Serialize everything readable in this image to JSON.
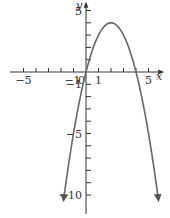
{
  "chart_data": {
    "type": "line",
    "title": "",
    "function": "y = -x^2 + 4x",
    "xlabel": "x",
    "ylabel": "y",
    "xlim": [
      -6,
      6.5
    ],
    "ylim": [
      -11.5,
      5.8
    ],
    "x_ticks": [
      -5,
      -4,
      -3,
      -2,
      -1,
      1,
      2,
      3,
      4,
      5
    ],
    "y_ticks": [
      5,
      4,
      3,
      2,
      1,
      -1,
      -2,
      -3,
      -4,
      -5,
      -6,
      -7,
      -8,
      -9,
      -10
    ],
    "x_tick_labels": [
      {
        "value": -5,
        "text": "−5"
      },
      {
        "value": -1,
        "text": "−1"
      },
      {
        "value": 0,
        "text": "0"
      },
      {
        "value": 1,
        "text": "1"
      },
      {
        "value": 5,
        "text": "5"
      }
    ],
    "y_tick_labels": [
      {
        "value": 5,
        "text": "5"
      },
      {
        "value": -1,
        "text": "−1"
      },
      {
        "value": -5,
        "text": "−5"
      },
      {
        "value": -10,
        "text": "−10"
      }
    ],
    "grid": false,
    "legend": null,
    "series": [
      {
        "name": "parabola",
        "x_range": [
          -1.8,
          5.8
        ],
        "vertex": [
          2,
          4
        ],
        "roots": [
          0,
          4
        ],
        "arrows_at_ends": true,
        "color": "#666666"
      }
    ]
  },
  "colors": {
    "axis": "#333333",
    "curve": "#666666"
  }
}
